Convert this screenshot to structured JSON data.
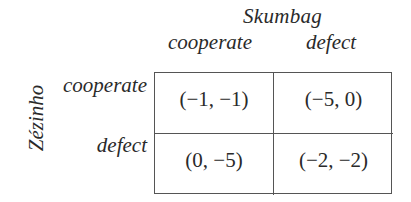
{
  "game": {
    "column_player": "Skumbag",
    "row_player": "Zézinho",
    "column_strategies": [
      "cooperate",
      "defect"
    ],
    "row_strategies": [
      "cooperate",
      "defect"
    ],
    "payoffs": [
      [
        "(−1, −1)",
        "(−5, 0)"
      ],
      [
        "(0, −5)",
        "(−2, −2)"
      ]
    ]
  },
  "colors": {
    "text": "#2a2a2a",
    "grid_lines": "#555555",
    "background": "#ffffff"
  }
}
